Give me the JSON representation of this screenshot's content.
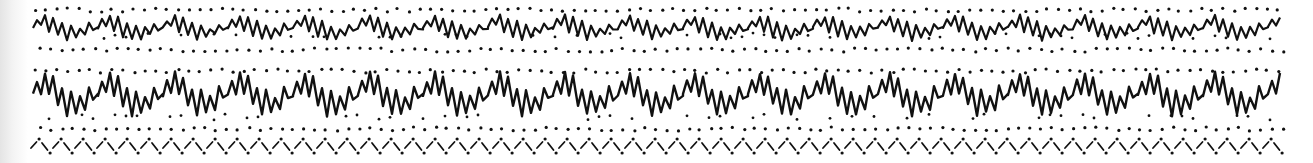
{
  "figure": {
    "background": "#ffffff",
    "ink": "#111111",
    "paper_shade": "#e4e4e4"
  },
  "pattern": {
    "x_start": 33,
    "x_end": 1282,
    "period": 65,
    "bands": [
      {
        "name": "top-wave",
        "baseline": 28,
        "amplitude": 14,
        "stroke_width": 2.2,
        "shape": [
          [
            0,
            0
          ],
          [
            4,
            -8
          ],
          [
            8,
            -2
          ],
          [
            12,
            -12
          ],
          [
            16,
            4
          ],
          [
            20,
            -10
          ],
          [
            25,
            8
          ],
          [
            29,
            -6
          ],
          [
            34,
            12
          ],
          [
            38,
            -2
          ],
          [
            43,
            10
          ],
          [
            47,
            0
          ],
          [
            52,
            6
          ],
          [
            56,
            -4
          ],
          [
            60,
            2
          ],
          [
            65,
            0
          ]
        ],
        "dots_above_y": 10,
        "dots_below_y": 50,
        "dots_mid_y": 36,
        "dot_spacing": 11
      },
      {
        "name": "middle-wave",
        "baseline": 95,
        "amplitude": 18,
        "stroke_width": 2.4,
        "shape": [
          [
            0,
            0
          ],
          [
            4,
            -14
          ],
          [
            8,
            -2
          ],
          [
            12,
            -22
          ],
          [
            16,
            0
          ],
          [
            20,
            -18
          ],
          [
            25,
            10
          ],
          [
            29,
            -6
          ],
          [
            34,
            20
          ],
          [
            38,
            -4
          ],
          [
            43,
            18
          ],
          [
            47,
            2
          ],
          [
            52,
            14
          ],
          [
            56,
            -8
          ],
          [
            60,
            4
          ],
          [
            65,
            0
          ]
        ],
        "dots_above_y": 71,
        "dots_below_y": 129,
        "dots_mid_y": 117,
        "dot_spacing": 11
      },
      {
        "name": "bottom-chevrons",
        "baseline": 146,
        "chevron_width": 22,
        "chevron_height": 8,
        "dot_top_y": 140,
        "dot_bottom_y": 153
      }
    ]
  }
}
